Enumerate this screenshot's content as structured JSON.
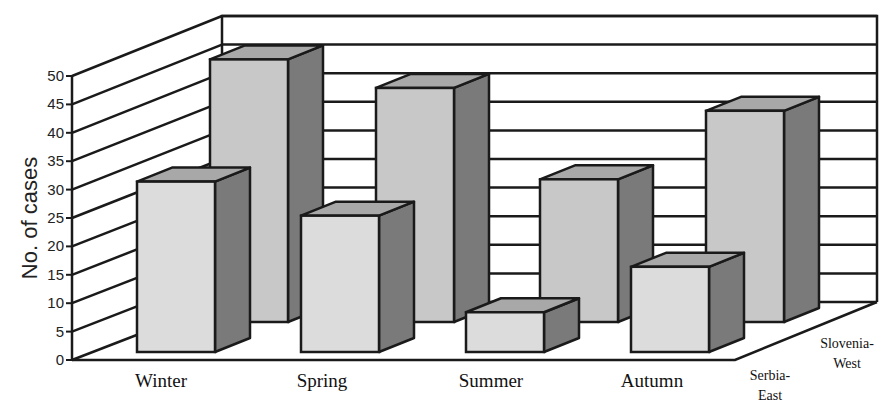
{
  "chart_data": {
    "type": "bar",
    "subtype": "3d-clustered-depth",
    "title": "",
    "xlabel": "",
    "ylabel": "No. of cases",
    "ylim": [
      0,
      50
    ],
    "yticks": [
      "0",
      "5",
      "10",
      "15",
      "20",
      "25",
      "30",
      "35",
      "40",
      "45",
      "50"
    ],
    "grid": true,
    "categories": [
      "Winter",
      "Spring",
      "Summer",
      "Autumn"
    ],
    "series": [
      {
        "name": "Serbia-East",
        "label_lines": [
          "Serbia-",
          "East"
        ],
        "values": [
          30,
          24,
          7,
          15
        ]
      },
      {
        "name": "Slovenia-West",
        "label_lines": [
          "Slovenia-",
          "West"
        ],
        "values": [
          46,
          41,
          25,
          37
        ]
      }
    ],
    "legend": "series labels on depth axis (bottom right)",
    "colors": {
      "front_face": "#dcdcdc",
      "back_series_face": "#c8c8c8",
      "side_face": "#7a7a7a",
      "top_face": "#a8a8a8",
      "lines": "#1a1a1a"
    }
  }
}
